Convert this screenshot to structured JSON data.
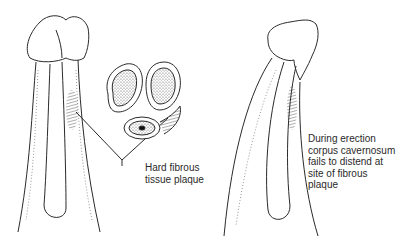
{
  "figure": {
    "panels": [
      {
        "id": "flaccid-view",
        "description": "Penis with fibrous plaque on corpus cavernosum"
      },
      {
        "id": "cross-section",
        "description": "Cross-section showing corpora cavernosa and corpus spongiosum with plaque"
      },
      {
        "id": "erect-view",
        "description": "Erect penis bending toward plaque site"
      }
    ],
    "labels": {
      "plaque": {
        "lines": [
          "Hard fibrous",
          "tissue plaque"
        ]
      },
      "erection": {
        "lines": [
          "During erection",
          "corpus cavernosum",
          "fails to distend at",
          "site of fibrous",
          "plaque"
        ]
      }
    },
    "colors": {
      "line": "#2a2a2a",
      "stipple": "#6a6a6a",
      "background": "#ffffff"
    }
  }
}
